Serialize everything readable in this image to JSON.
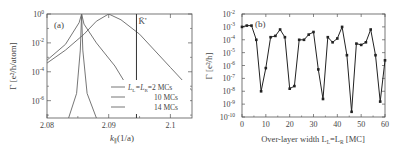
{
  "chart_data": [
    {
      "panel": "(a)",
      "type": "line",
      "title": "",
      "xlabel": "k_∥ (1/a)",
      "ylabel": "Γ [e²/h/atom]",
      "yscale": "log",
      "xlim": [
        2.08,
        2.1035
      ],
      "ylim_exponent": [
        -7.2,
        0
      ],
      "x_ticks": [
        "2.08",
        "2.09",
        "2.1"
      ],
      "y_ticks": [
        "10^0",
        "10^-2",
        "10^-4",
        "10^-6"
      ],
      "annotations": [
        {
          "text": "K̄'",
          "x": 2.0945,
          "type": "vertical-line"
        }
      ],
      "legend": {
        "position": "lower-right",
        "entries": [
          "L_L=L_R=2 MCs",
          "10 MCs",
          "14 MCs"
        ]
      },
      "series": [
        {
          "name": "L_L=L_R=2 MCs",
          "x": [
            2.08,
            2.083,
            2.086,
            2.088,
            2.09,
            2.092,
            2.095,
            2.1,
            2.1035
          ],
          "log10_y": [
            -3.4,
            -2.5,
            -1.4,
            -0.5,
            0,
            -0.4,
            -1.4,
            -3.7,
            -5.3
          ]
        },
        {
          "name": "10 MCs",
          "x": [
            2.08,
            2.083,
            2.0852,
            2.0856,
            2.086,
            2.088,
            2.091,
            2.093,
            2.0935
          ],
          "log10_y": [
            -3.2,
            -2.1,
            -0.6,
            0,
            -0.7,
            -2.0,
            -3.6,
            -5.0,
            -5.3
          ]
        },
        {
          "name": "14 MCs",
          "x": [
            2.0835,
            2.0848,
            2.0854,
            2.0856,
            2.0858,
            2.0865,
            2.088
          ],
          "log10_y": [
            -7.2,
            -5.5,
            -2.5,
            0,
            -2.5,
            -5.5,
            -7.2
          ]
        }
      ]
    },
    {
      "panel": "(b)",
      "type": "line",
      "title": "",
      "xlabel": "Over-layer width L_L=L_R [MC]",
      "ylabel": "Γ [e²/h]",
      "yscale": "log",
      "xlim": [
        0,
        60
      ],
      "ylim_exponent": [
        -10,
        -2
      ],
      "x_ticks": [
        "0",
        "10",
        "20",
        "30",
        "40",
        "50",
        "60"
      ],
      "y_ticks": [
        "10^-2",
        "10^-3",
        "10^-4",
        "10^-5",
        "10^-6",
        "10^-7",
        "10^-8",
        "10^-9",
        "10^-10"
      ],
      "markers": "square",
      "series": [
        {
          "name": "Γ",
          "x": [
            0,
            2,
            4,
            6,
            8,
            10,
            12,
            14,
            16,
            18,
            20,
            22,
            24,
            26,
            28,
            30,
            32,
            34,
            36,
            38,
            40,
            42,
            44,
            46,
            48,
            50,
            52,
            54,
            56,
            58,
            60
          ],
          "log10_y": [
            -3.0,
            -2.9,
            -2.9,
            -4.0,
            -8.0,
            -6.2,
            -3.8,
            -3.7,
            -3.2,
            -3.8,
            -7.8,
            -7.6,
            -4.0,
            -4.0,
            -3.6,
            -3.4,
            -6.3,
            -8.6,
            -3.8,
            -4.2,
            -3.9,
            -3.0,
            -5.2,
            -9.6,
            -4.3,
            -4.4,
            -4.2,
            -3.2,
            -5.2,
            -8.8,
            -5.6
          ]
        }
      ]
    }
  ],
  "labels": {
    "panel_a": "(a)",
    "panel_b": "(b)",
    "kbar": "K̄'",
    "a_ylabel": "Γ [e²/h/atom]",
    "a_xlabel_main": "k",
    "a_xlabel_sub": "∥",
    "a_xlabel_unit": "(1/a)",
    "b_ylabel": "Γ [e²/h]",
    "b_xlabel": "Over-layer width L",
    "b_xlabel_sub1": "L",
    "b_xlabel_mid": "=L",
    "b_xlabel_sub2": "R",
    "b_xlabel_unit": " [MC]",
    "legend_1_pre": "L",
    "legend_1_sub1": "L",
    "legend_1_mid": "=L",
    "legend_1_sub2": "R",
    "legend_1_post": "=2 MCs",
    "legend_2": "10 MCs",
    "legend_3": "14 MCs"
  }
}
